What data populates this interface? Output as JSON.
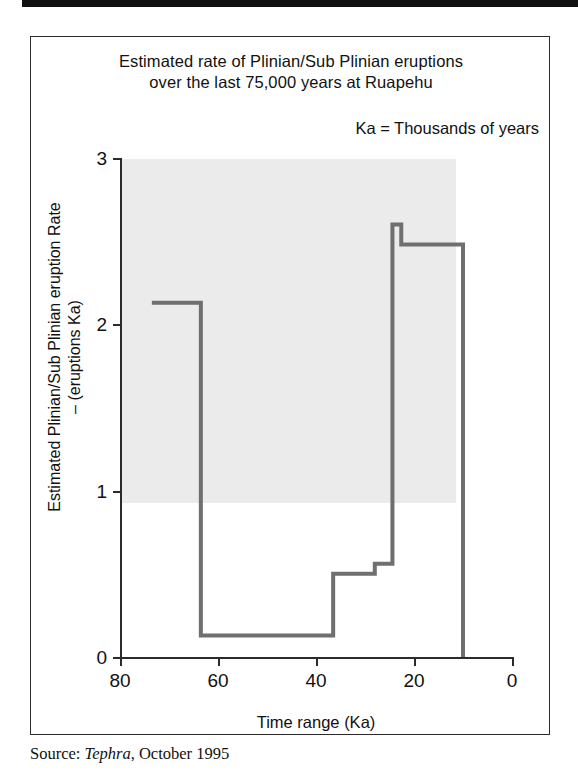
{
  "figure": {
    "title_line1": "Estimated rate of Plinian/Sub Plinian eruptions",
    "title_line2": "over the last 75,000 years at Ruapehu",
    "note": "Ka = Thousands of years",
    "source_prefix": "Source: ",
    "source_publication": "Tephra",
    "source_suffix": ", October 1995"
  },
  "chart_data": {
    "type": "line",
    "subtype": "step",
    "title": "Estimated rate of Plinian/Sub Plinian eruptions over the last 75,000 years at Ruapehu",
    "annotation": "Ka = Thousands of years",
    "xlabel": "Time range (Ka)",
    "ylabel": "Estimated Plinian/Sub Plinian eruption Rate – (eruptions Ka)",
    "ylabel_line1": "Estimated Plinian/Sub Plinian eruption Rate",
    "ylabel_line2": "– (eruptions Ka)",
    "xlim": [
      80,
      0
    ],
    "ylim": [
      0,
      3
    ],
    "x_reversed": true,
    "grid": false,
    "legend": null,
    "xticks": [
      80,
      60,
      40,
      20,
      0
    ],
    "xtick_labels": [
      "80",
      "60",
      "40",
      "20",
      "0"
    ],
    "yticks": [
      0,
      1,
      2,
      3
    ],
    "ytick_labels": [
      "0",
      "1",
      "2",
      "3"
    ],
    "plot_background": "#ebebeb",
    "line_color": "#6f6f6f",
    "axis_color": "#2b2b2b",
    "steps": [
      {
        "x_start": 73.5,
        "x_end": 63.5,
        "value": 2.13
      },
      {
        "x_start": 63.5,
        "x_end": 36.5,
        "value": 0.13
      },
      {
        "x_start": 36.5,
        "x_end": 28.0,
        "value": 0.5
      },
      {
        "x_start": 28.0,
        "x_end": 24.4,
        "value": 0.56
      },
      {
        "x_start": 24.4,
        "x_end": 22.6,
        "value": 2.6
      },
      {
        "x_start": 22.6,
        "x_end": 10.0,
        "value": 2.48
      }
    ],
    "series": [
      {
        "name": "Estimated Plinian/Sub Plinian eruption rate",
        "x": [
          73.5,
          63.5,
          63.5,
          36.5,
          36.5,
          28.0,
          28.0,
          24.4,
          24.4,
          22.6,
          22.6,
          10.0,
          10.0
        ],
        "y": [
          2.13,
          2.13,
          0.13,
          0.13,
          0.5,
          0.5,
          0.56,
          0.56,
          2.6,
          2.6,
          2.48,
          2.48,
          0.0
        ]
      }
    ]
  }
}
